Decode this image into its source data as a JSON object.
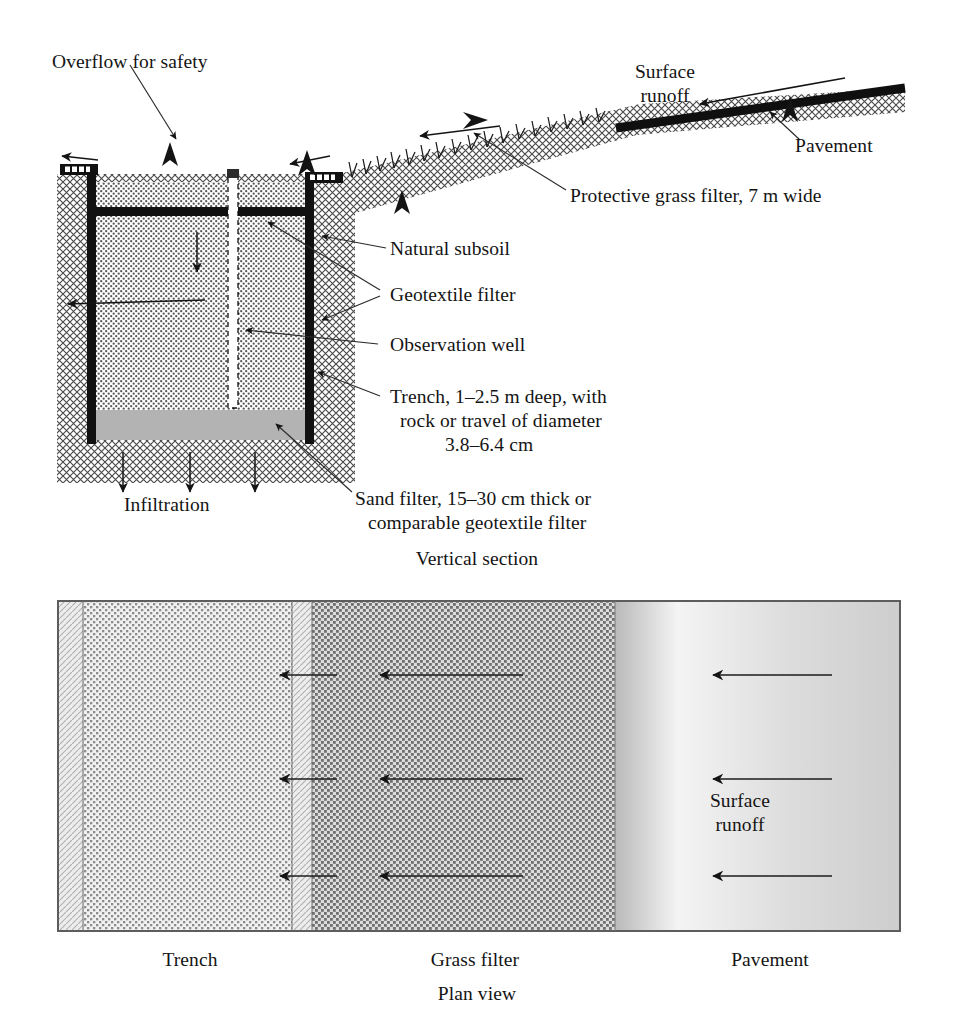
{
  "figure": {
    "type": "engineering-cross-section-and-plan-diagram"
  },
  "vertical_section": {
    "caption": "Vertical section",
    "labels": {
      "overflow": "Overflow for safety",
      "surface_runoff": "Surface\nrunoff",
      "pavement": "Pavement",
      "grass_filter": "Protective grass filter, 7 m wide",
      "natural_subsoil": "Natural subsoil",
      "geotextile_filter": "Geotextile filter",
      "observation_well": "Observation well",
      "trench_line1": "Trench, 1–2.5 m deep, with",
      "trench_line2": "rock or travel of diameter",
      "trench_line3": "3.8–6.4 cm",
      "sand_filter_line1": "Sand filter, 15–30 cm thick or",
      "sand_filter_line2": "comparable geotextile filter",
      "infiltration": "Infiltration"
    },
    "dimensions": {
      "trench_depth": "1–2.5 m",
      "rock_diameter": "3.8–6.4 cm",
      "sand_filter_thickness": "15–30 cm",
      "grass_filter_width": "7 m"
    }
  },
  "plan_view": {
    "caption": "Plan view",
    "zone_labels": [
      "Trench",
      "Grass filter",
      "Pavement"
    ],
    "runoff_label": "Surface\nrunoff",
    "arrow_rows": 3
  },
  "colors": {
    "ink": "#141414",
    "trench_fill": "#d8d8d8",
    "subsoil_fill": "#cfcfcf",
    "sand_fill": "#b4b4b4",
    "pavement_fill": "#d2d2d2",
    "grass_fill": "#bdbdbd",
    "border": "#6f6f6f"
  }
}
